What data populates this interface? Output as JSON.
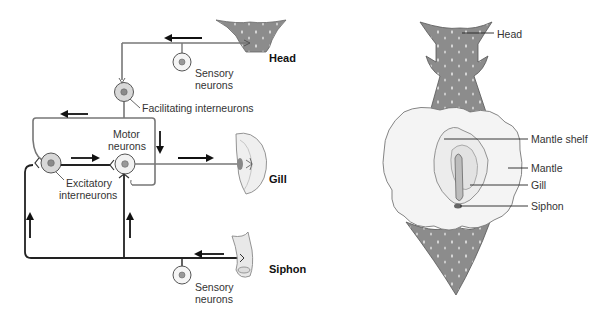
{
  "left_diagram": {
    "title": "Gill-withdrawal reflex neural circuit",
    "labels": {
      "head": "Head",
      "gill": "Gill",
      "siphon": "Siphon",
      "sensory_top_1": "Sensory",
      "sensory_top_2": "neurons",
      "facilitating": "Facilitating interneurons",
      "motor_1": "Motor",
      "motor_2": "neurons",
      "excitatory_1": "Excitatory",
      "excitatory_2": "interneurons",
      "sensory_bottom_1": "Sensory",
      "sensory_bottom_2": "neurons"
    },
    "arrows": [
      {
        "location": "head-pathway",
        "direction": "left"
      },
      {
        "location": "facilitating-output",
        "direction": "left"
      },
      {
        "location": "facilitating-to-motor",
        "direction": "down"
      },
      {
        "location": "excitatory-to-motor",
        "direction": "right"
      },
      {
        "location": "motor-to-gill",
        "direction": "right"
      },
      {
        "location": "left-vertical",
        "direction": "up"
      },
      {
        "location": "middle-vertical",
        "direction": "up"
      },
      {
        "location": "siphon-pathway",
        "direction": "left"
      }
    ]
  },
  "right_diagram": {
    "title": "Aplysia dorsal view",
    "labels": {
      "head": "Head",
      "mantle_shelf": "Mantle shelf",
      "mantle": "Mantle",
      "gill": "Gill",
      "siphon": "Siphon"
    }
  },
  "colors": {
    "body_gray": "#8a8a8a",
    "mantle": "#f2f2f2",
    "neuron_fill": "#d8d8d8",
    "line": "#222222"
  }
}
